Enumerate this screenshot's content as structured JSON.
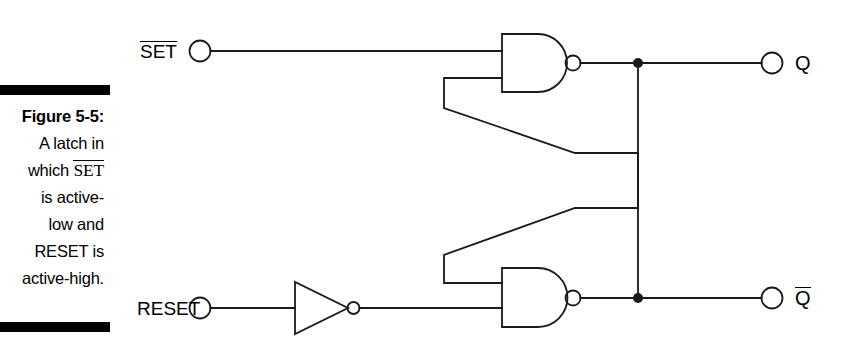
{
  "figure": {
    "caption_lines": [
      {
        "text": "Figure 5-5:",
        "bold": true
      },
      {
        "text": "A latch in",
        "bold": false
      },
      {
        "text": "which SET",
        "bold": false,
        "overline_word": "SET"
      },
      {
        "text": "is active-",
        "bold": false
      },
      {
        "text": "low and",
        "bold": false
      },
      {
        "text": "RESET is",
        "bold": false
      },
      {
        "text": "active-high.",
        "bold": false
      }
    ],
    "caption_label": "Figure 5-5:",
    "caption_line_2": "A latch in",
    "caption_line_3_prefix": "which ",
    "caption_line_3_overlined": "SET",
    "caption_line_4": "is active-",
    "caption_line_5": "low and",
    "caption_line_6": "RESET is",
    "caption_line_7": "active-high.",
    "rule_color": "#000000"
  },
  "circuit": {
    "type": "SR latch (cross-coupled NAND)",
    "line_color": "#000000",
    "inputs": [
      {
        "name": "set-input",
        "label": "SET",
        "overline": true,
        "terminal_x": 200,
        "terminal_y": 51,
        "active": "low"
      },
      {
        "name": "reset-input",
        "label": "RESET",
        "overline": false,
        "terminal_x": 200,
        "terminal_y": 308,
        "active": "high"
      }
    ],
    "outputs": [
      {
        "name": "q-output",
        "label": "Q",
        "overline": false,
        "terminal_x": 772,
        "terminal_y": 63
      },
      {
        "name": "qbar-output",
        "label": "Q",
        "overline": true,
        "terminal_x": 772,
        "terminal_y": 298
      }
    ],
    "gates": [
      {
        "name": "nand-gate-top",
        "type": "NAND",
        "x": 502,
        "y": 34,
        "width": 73,
        "height": 58,
        "bubble_x": 580,
        "bubble_y": 63
      },
      {
        "name": "nand-gate-bottom",
        "type": "NAND",
        "x": 502,
        "y": 268,
        "width": 73,
        "height": 59,
        "bubble_x": 580,
        "bubble_y": 298
      },
      {
        "name": "inverter-gate",
        "type": "NOT",
        "x": 295,
        "y": 282,
        "width": 53,
        "height": 52,
        "bubble_x": 358,
        "bubble_y": 308
      }
    ],
    "junctions": [
      {
        "name": "junction-q",
        "x": 638,
        "y": 63
      },
      {
        "name": "junction-qbar",
        "x": 638,
        "y": 298
      }
    ],
    "labels": {
      "set": "SET",
      "reset": "RESET",
      "q": "Q",
      "qbar": "Q"
    }
  }
}
